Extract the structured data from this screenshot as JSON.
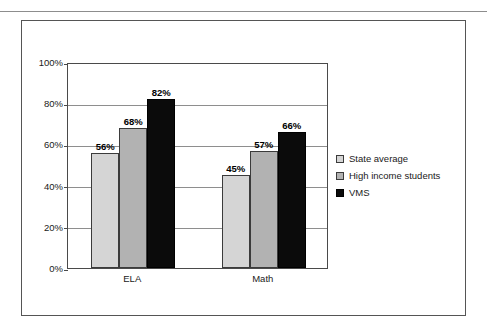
{
  "page": {
    "background": "#ffffff",
    "rule_color": "#8d8d8d",
    "frame_color": "#555555"
  },
  "chart_data": {
    "type": "bar",
    "title": "",
    "subtitle": "",
    "xlabel": "",
    "ylabel": "",
    "categories": [
      "ELA",
      "Math"
    ],
    "series": [
      {
        "name": "State average",
        "values": [
          56,
          68
        ],
        "color": "#d5d5d5"
      },
      {
        "name": "High income students",
        "values": [
          68,
          57
        ],
        "color": "#b2b2b2"
      },
      {
        "name": "VMS",
        "values": [
          82,
          66
        ],
        "color": "#0b0b0b"
      }
    ],
    "series_by_category": {
      "ELA": {
        "State average": 56,
        "High income students": 68,
        "VMS": 82
      },
      "Math": {
        "State average": 45,
        "High income students": 57,
        "VMS": 66
      }
    },
    "bars": [
      {
        "category": "ELA",
        "series": "State average",
        "value": 56,
        "label": "56%",
        "color": "#d5d5d5"
      },
      {
        "category": "ELA",
        "series": "High income students",
        "value": 68,
        "label": "68%",
        "color": "#b2b2b2"
      },
      {
        "category": "ELA",
        "series": "VMS",
        "value": 82,
        "label": "82%",
        "color": "#0b0b0b"
      },
      {
        "category": "Math",
        "series": "State average",
        "value": 45,
        "label": "45%",
        "color": "#d5d5d5"
      },
      {
        "category": "Math",
        "series": "High income students",
        "value": 57,
        "label": "57%",
        "color": "#b2b2b2"
      },
      {
        "category": "Math",
        "series": "VMS",
        "value": 66,
        "label": "66%",
        "color": "#0b0b0b"
      }
    ],
    "ylim": [
      0,
      100
    ],
    "yticks": [
      0,
      20,
      40,
      60,
      80,
      100
    ],
    "ytick_labels": [
      "0%",
      "20%",
      "40%",
      "60%",
      "80%",
      "100%"
    ],
    "grid": true,
    "grid_axis": "y",
    "legend_position": "right",
    "data_labels": true,
    "data_label_suffix": "%"
  },
  "legend": {
    "items": [
      {
        "label": "State average",
        "color": "#d5d5d5"
      },
      {
        "label": "High income students",
        "color": "#b2b2b2"
      },
      {
        "label": "VMS",
        "color": "#0b0b0b"
      }
    ]
  }
}
